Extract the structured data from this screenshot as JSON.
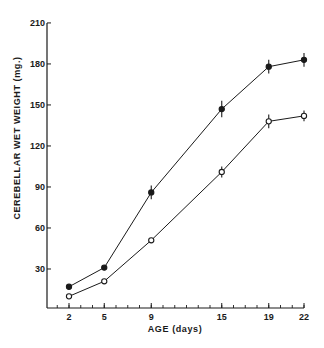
{
  "chart_data": {
    "type": "line",
    "title": "",
    "xlabel": "AGE (days)",
    "ylabel": "CEREBELLAR WET WEIGHT (mg.)",
    "x": [
      2,
      5,
      9,
      15,
      19,
      22
    ],
    "xticks": [
      "2",
      "5",
      "9",
      "15",
      "19",
      "22"
    ],
    "yticks": [
      "30",
      "60",
      "90",
      "120",
      "150",
      "180",
      "210"
    ],
    "ylim": [
      0,
      210
    ],
    "xlim": [
      0,
      22
    ],
    "grid": false,
    "legend": null,
    "series": [
      {
        "name": "filled-circles",
        "marker": "filled-circle",
        "values": [
          17,
          31,
          86,
          147,
          178,
          183
        ],
        "error": [
          1,
          1,
          5,
          6,
          5,
          5
        ]
      },
      {
        "name": "open-circles",
        "marker": "open-circle",
        "values": [
          10,
          21,
          51,
          101,
          138,
          142
        ],
        "error": [
          1,
          1,
          1,
          4,
          5,
          4
        ]
      }
    ]
  },
  "axes": {
    "x_label": "AGE (days)",
    "y_label": "CEREBELLAR WET WEIGHT (mg.)"
  },
  "colors": {
    "ink": "#1a1a1a",
    "background": "#ffffff"
  }
}
